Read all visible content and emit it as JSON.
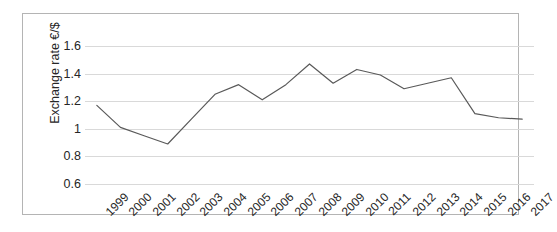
{
  "chart_data": {
    "type": "line",
    "title": "",
    "xlabel": "",
    "ylabel": "Exchange rate €/$",
    "ylim": [
      0.6,
      1.6
    ],
    "yticks": [
      "0.6",
      "0.8",
      "1",
      "1.2",
      "1.4",
      "1.6"
    ],
    "ytick_values": [
      0.6,
      0.8,
      1.0,
      1.2,
      1.4,
      1.6
    ],
    "grid": true,
    "legend": "none",
    "line_color": "#595959",
    "categories": [
      "1999",
      "2000",
      "2001",
      "2002",
      "2003",
      "2004",
      "2005",
      "2006",
      "2007",
      "2008",
      "2009",
      "2010",
      "2011",
      "2012",
      "2013",
      "2014",
      "2015",
      "2016",
      "2017"
    ],
    "values": [
      1.17,
      1.01,
      0.95,
      0.89,
      1.07,
      1.25,
      1.32,
      1.21,
      1.32,
      1.47,
      1.33,
      1.43,
      1.39,
      1.29,
      1.33,
      1.37,
      1.11,
      1.08,
      1.07
    ]
  }
}
